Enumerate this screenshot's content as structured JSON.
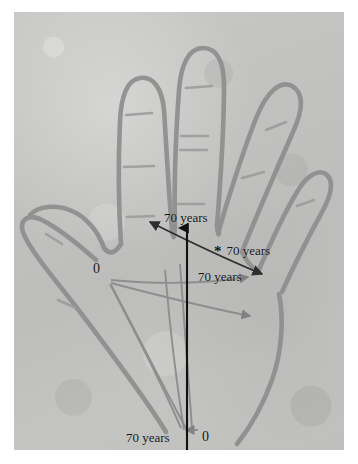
{
  "figure": {
    "kind": "photograph-of-hand-outline-diagram",
    "background_color": "#c2c2c0",
    "outline_color": "#8e8e8e",
    "plate_border_color": "#ffffff"
  },
  "annotations": {
    "axis_label_text": "70 years",
    "origin_label_text": "0",
    "starred_label_marker": "*",
    "labels": [
      {
        "id": "top-axis",
        "text": "70 years",
        "x": 164,
        "y": 208,
        "anchor": "start"
      },
      {
        "id": "starred-axis",
        "text": "70 years",
        "x": 228,
        "y": 240,
        "anchor": "start"
      },
      {
        "id": "diagonal-axis",
        "text": "70 years",
        "x": 198,
        "y": 267,
        "anchor": "start"
      },
      {
        "id": "bottom-axis",
        "text": "70 years",
        "x": 126,
        "y": 428,
        "anchor": "start"
      }
    ],
    "origins": [
      {
        "id": "left-origin",
        "text": "0",
        "x": 93,
        "y": 260
      },
      {
        "id": "bottom-origin",
        "text": "0",
        "x": 202,
        "y": 427
      }
    ],
    "star": {
      "x": 214,
      "y": 238
    }
  },
  "arrows": {
    "vertical_black": {
      "color": "#111111",
      "from": [
        187,
        450
      ],
      "to": [
        187,
        222
      ]
    },
    "diagonal_dark": {
      "color": "#3a3a3a",
      "from": [
        257,
        272
      ],
      "to": [
        142,
        220
      ]
    },
    "gray_fan": {
      "color": "#8c8c8c"
    }
  },
  "hand": {
    "digits": [
      "thumb",
      "index",
      "middle",
      "ring",
      "little"
    ],
    "crease_marks": 11
  }
}
